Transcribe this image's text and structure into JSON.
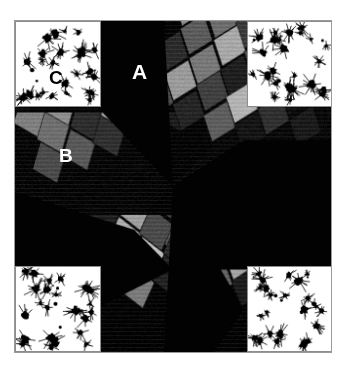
{
  "figure": {
    "kind": "electron-micrograph",
    "canvas_width": 344,
    "canvas_height": 374,
    "background_color": "#ffffff",
    "panel": {
      "x": 14,
      "y": 20,
      "width": 318,
      "height": 333,
      "background_color": "#000000",
      "border_color": "#9a9a9a"
    }
  },
  "labels": {
    "a": "A",
    "b": "B",
    "c": "C"
  },
  "palette": {
    "background": "#000000",
    "frame": "#9a9a9a",
    "inset_background": "#ffffff",
    "inset_border": "#8d8d8d",
    "particle": "#000000",
    "label_light": "#ffffff",
    "label_dark": "#000000",
    "grain_tones": [
      "#000000",
      "#101010",
      "#1d1d1d",
      "#2c2c2c",
      "#3d3d3d",
      "#4f4f4f",
      "#5e5e5e",
      "#6d6d6d",
      "#7c7c7c",
      "#8d8d8d",
      "#9e9e9e",
      "#b2b2b2",
      "#c3c3c3"
    ]
  },
  "micrograph": {
    "description": "Dark-field pinwheel of four rhombic grain domains radiating from centre",
    "center": [
      159,
      166
    ],
    "sectors": [
      {
        "name": "sector-left",
        "polygon": [
          [
            0,
            0
          ],
          [
            159,
            166
          ],
          [
            0,
            333
          ]
        ],
        "tone": "#000000"
      },
      {
        "name": "sector-top",
        "polygon": [
          [
            0,
            0
          ],
          [
            318,
            0
          ],
          [
            159,
            166
          ]
        ],
        "tone": "#000000"
      },
      {
        "name": "sector-right",
        "polygon": [
          [
            318,
            0
          ],
          [
            318,
            333
          ],
          [
            159,
            166
          ]
        ],
        "tone": "#000000"
      },
      {
        "name": "sector-bottom",
        "polygon": [
          [
            0,
            333
          ],
          [
            318,
            333
          ],
          [
            159,
            166
          ]
        ],
        "tone": "#000000"
      }
    ],
    "domains": [
      {
        "name": "domain-upper-left",
        "clip": [
          [
            0,
            92
          ],
          [
            178,
            92
          ],
          [
            178,
            172
          ],
          [
            0,
            172
          ]
        ],
        "origin": [
          14,
          96
        ],
        "angle": -22,
        "cols": 6,
        "rows": 3,
        "cell_w": 34,
        "cell_h": 40,
        "tones": [
          [
            "#7f7f7f",
            "#8f8f8f",
            "#5a5a5a",
            "#1a1a1a",
            "#0c0c0c",
            "#060606"
          ],
          [
            "#6e6e6e",
            "#2b2b2b",
            "#b6b6b6",
            "#3a3a3a",
            "#9a9a9a",
            "#242424"
          ],
          [
            "#4a4a4a",
            "#585858",
            "#2f2f2f",
            "#767676",
            "#1b1b1b",
            "#101010"
          ]
        ]
      },
      {
        "name": "domain-upper-right",
        "clip": [
          [
            150,
            0
          ],
          [
            318,
            0
          ],
          [
            318,
            120
          ],
          [
            150,
            190
          ]
        ],
        "origin": [
          176,
          -14
        ],
        "angle": 20,
        "cols": 5,
        "rows": 5,
        "cell_w": 33,
        "cell_h": 39,
        "tones": [
          [
            "#8a8a8a",
            "#6c6c6c",
            "#3a3a3a",
            "#141414",
            "#0a0a0a"
          ],
          [
            "#5b5b5b",
            "#a9a9a9",
            "#4f4f4f",
            "#c0c0c0",
            "#1d1d1d"
          ],
          [
            "#2a2a2a",
            "#787878",
            "#1c1c1c",
            "#666666",
            "#0e0e0e"
          ],
          [
            "#9b9b9b",
            "#3f3f3f",
            "#b4b4b4",
            "#2e2e2e",
            "#181818"
          ],
          [
            "#4b4b4b",
            "#232323",
            "#5d5d5d",
            "#121212",
            "#080808"
          ]
        ]
      },
      {
        "name": "domain-lower-right",
        "clip": [
          [
            150,
            175
          ],
          [
            318,
            175
          ],
          [
            318,
            300
          ],
          [
            150,
            300
          ]
        ],
        "origin": [
          178,
          176
        ],
        "angle": 18,
        "cols": 6,
        "rows": 4,
        "cell_w": 33,
        "cell_h": 38,
        "tones": [
          [
            "#6f6f6f",
            "#9d9d9d",
            "#2c2c2c",
            "#575757",
            "#121212",
            "#0a0a0a"
          ],
          [
            "#3b3b3b",
            "#7e7e7e",
            "#b8b8b8",
            "#1f1f1f",
            "#8c8c8c",
            "#262626"
          ],
          [
            "#5a5a5a",
            "#1a1a1a",
            "#a4a4a4",
            "#434343",
            "#6a6a6a",
            "#0f0f0f"
          ],
          [
            "#2e2e2e",
            "#626262",
            "#1b1b1b",
            "#949494",
            "#2a2a2a",
            "#101010"
          ]
        ]
      },
      {
        "name": "domain-lower-left",
        "clip": [
          [
            70,
            195
          ],
          [
            200,
            195
          ],
          [
            200,
            333
          ],
          [
            70,
            333
          ]
        ],
        "origin": [
          88,
          198
        ],
        "angle": -14,
        "cols": 4,
        "rows": 4,
        "cell_w": 34,
        "cell_h": 40,
        "tones": [
          [
            "#1c1c1c",
            "#9f9f9f",
            "#353535",
            "#0b0b0b"
          ],
          [
            "#b0b0b0",
            "#4a4a4a",
            "#6e6e6e",
            "#1a1a1a"
          ],
          [
            "#3e3e3e",
            "#c2c2c2",
            "#2b2b2b",
            "#0d0d0d"
          ],
          [
            "#7a7a7a",
            "#222222",
            "#565656",
            "#101010"
          ]
        ]
      }
    ]
  },
  "insets": [
    {
      "id": "inset-tl",
      "name": "inset-top-left",
      "x": 0,
      "y": 0,
      "width": 86,
      "height": 86,
      "label": "C",
      "particle_count": 26,
      "particle_color": "#000000",
      "background_color": "#ffffff"
    },
    {
      "id": "inset-tr",
      "name": "inset-top-right",
      "x": 232,
      "y": 0,
      "width": 86,
      "height": 86,
      "label": "",
      "particle_count": 24,
      "particle_color": "#000000",
      "background_color": "#ffffff"
    },
    {
      "id": "inset-bl",
      "name": "inset-bottom-left",
      "x": 0,
      "y": 245,
      "width": 86,
      "height": 86,
      "label": "",
      "particle_count": 22,
      "particle_color": "#000000",
      "background_color": "#ffffff"
    },
    {
      "id": "inset-br",
      "name": "inset-bottom-right",
      "x": 232,
      "y": 245,
      "width": 86,
      "height": 86,
      "label": "",
      "particle_count": 25,
      "particle_color": "#000000",
      "background_color": "#ffffff"
    }
  ]
}
